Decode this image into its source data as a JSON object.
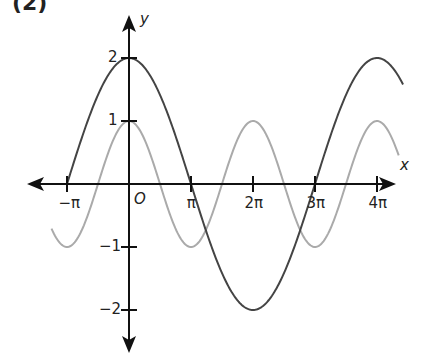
{
  "figure": {
    "panel_label": "(2)"
  },
  "chart_data": {
    "type": "line",
    "title": "",
    "xlabel": "x",
    "ylabel": "y",
    "origin_label": "O",
    "x_range_pi": [
      -1.25,
      4.4
    ],
    "ylim": [
      -2.4,
      2.7
    ],
    "grid": false,
    "legend": null,
    "x_ticks": [
      {
        "value_pi": -1,
        "label": "−π"
      },
      {
        "value_pi": 1,
        "label": "π"
      },
      {
        "value_pi": 2,
        "label": "2π"
      },
      {
        "value_pi": 3,
        "label": "3π"
      },
      {
        "value_pi": 4,
        "label": "4π"
      }
    ],
    "y_ticks": [
      {
        "value": 2,
        "label": "2"
      },
      {
        "value": 1,
        "label": "1"
      },
      {
        "value": -1,
        "label": "−1"
      },
      {
        "value": -2,
        "label": "−2"
      }
    ],
    "series": [
      {
        "name": "y = 2cos(x/2)",
        "amplitude": 2,
        "frequency": 0.5,
        "x_start_pi": -1,
        "x_end_pi": 4.42,
        "color": "#444444"
      },
      {
        "name": "y = cos(x)",
        "amplitude": 1,
        "frequency": 1,
        "x_start_pi": -1.25,
        "x_end_pi": 4.35,
        "color": "#aaaaaa"
      }
    ]
  },
  "layout": {
    "origin_px": [
      129,
      184
    ],
    "px_per_pi": 62,
    "px_per_unit": 63,
    "x_axis_px": [
      27,
      396
    ],
    "y_axis_px": [
      15,
      353
    ]
  }
}
